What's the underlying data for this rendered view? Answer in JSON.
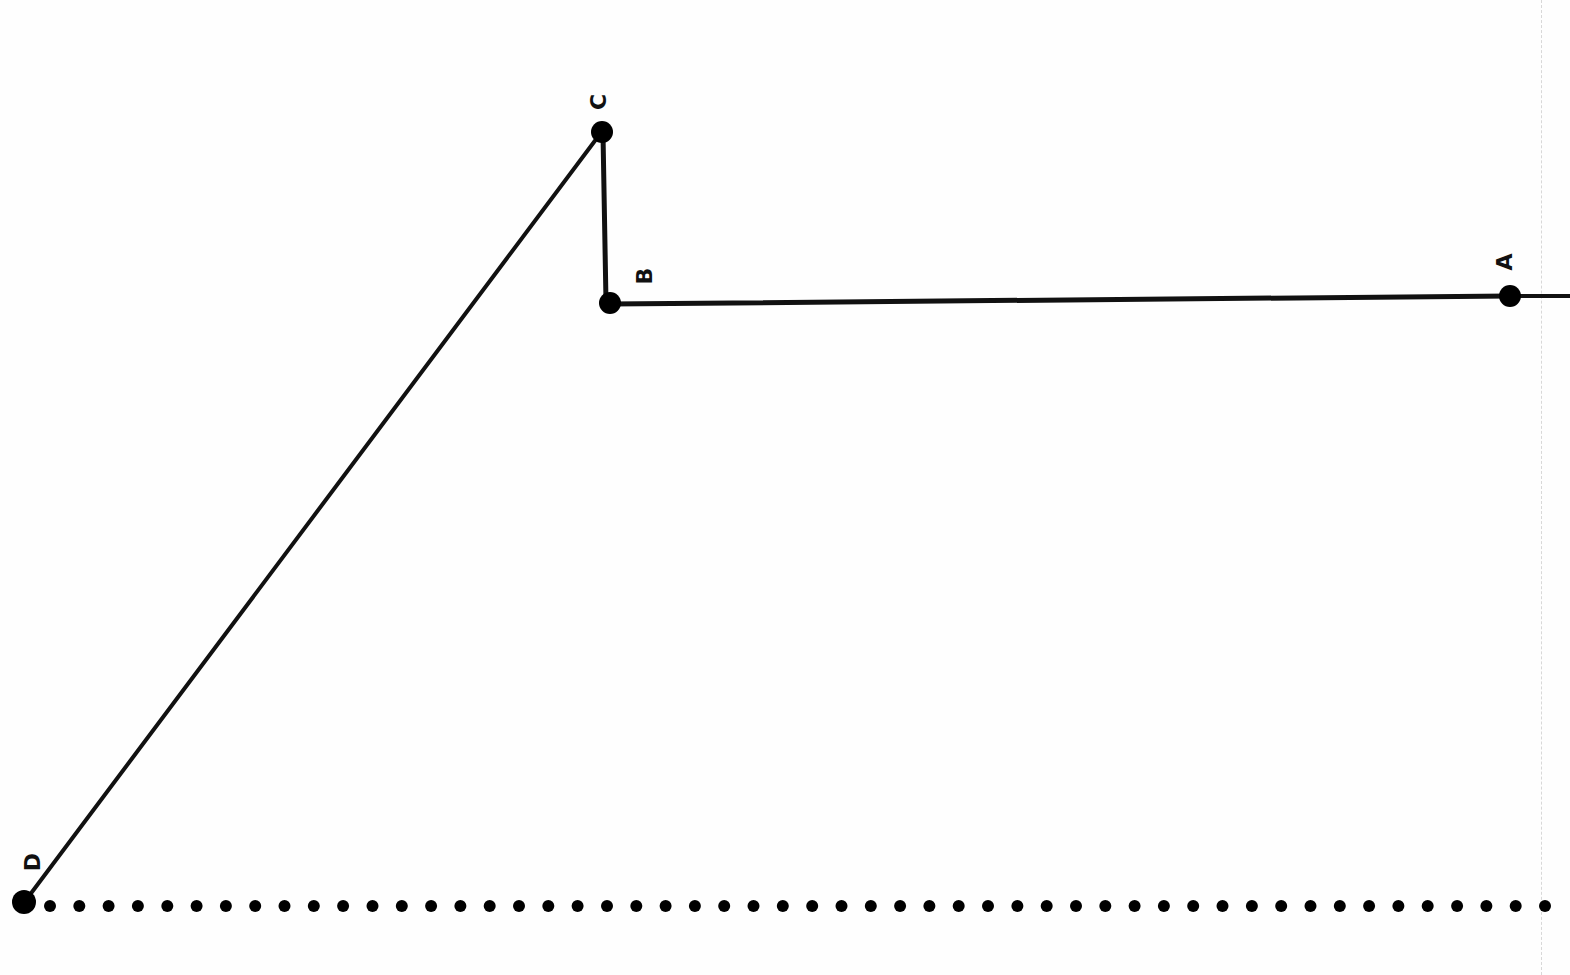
{
  "diagram": {
    "type": "polyline-path",
    "orientation": "rotated-90",
    "colors": {
      "line": "#111111",
      "point": "#000000",
      "background": "#fefefe",
      "guide": "#d8d8d8"
    },
    "points": [
      {
        "id": "A",
        "label": "A",
        "x": 1510,
        "y": 296
      },
      {
        "id": "B",
        "label": "B",
        "x": 610,
        "y": 303
      },
      {
        "id": "C",
        "label": "C",
        "x": 602,
        "y": 132
      },
      {
        "id": "D",
        "label": "D",
        "x": 24,
        "y": 902
      }
    ],
    "segments": [
      {
        "from": "edge",
        "to": "A"
      },
      {
        "from": "A",
        "to": "B"
      },
      {
        "from": "B",
        "to": "C"
      },
      {
        "from": "C",
        "to": "D"
      }
    ],
    "baseline": {
      "style": "dotted",
      "y": 906,
      "x_start": 50,
      "x_end": 1545,
      "dot_count": 52
    }
  }
}
